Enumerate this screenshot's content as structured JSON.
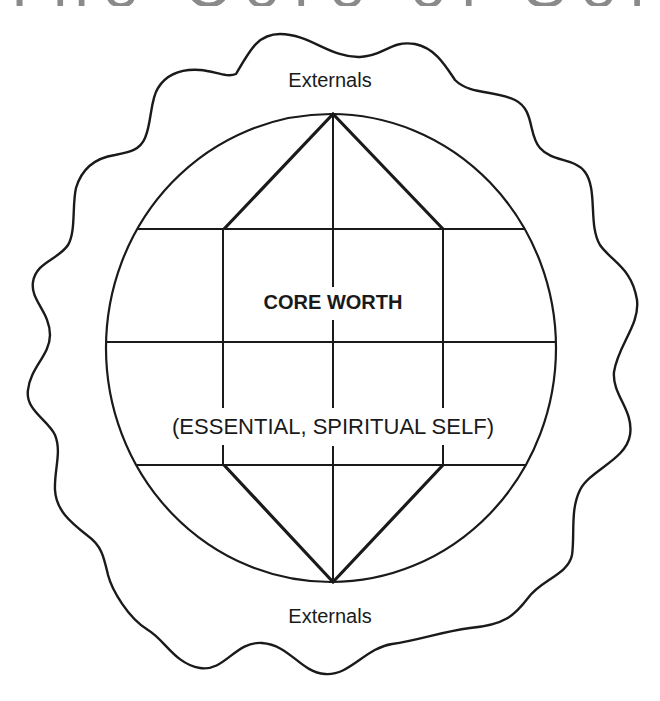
{
  "title": {
    "text": "The Core of Self",
    "visible": "clipped-bottom-fragments-only"
  },
  "labels": {
    "externals_top": "Externals",
    "core_worth": "CORE WORTH",
    "essential_self": "(ESSENTIAL, SPIRITUAL SELF)",
    "externals_bottom": "Externals"
  },
  "shapes": {
    "outer_boundary": "wavy-irregular-outline",
    "inner_circle": "globe-circle",
    "grid": "three-horizontal-three-vertical-lines",
    "diamond": "elongated-hexagon-core"
  },
  "colors": {
    "stroke": "#1a1a1a",
    "background": "#ffffff"
  }
}
